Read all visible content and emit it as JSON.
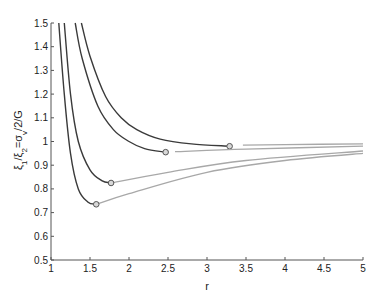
{
  "chart_data": {
    "type": "line",
    "title": "",
    "xlabel": "r",
    "ylabel": "ξ1/ξ2=σv/2/G",
    "xlim": [
      1,
      5
    ],
    "ylim": [
      0.5,
      1.5
    ],
    "xticks": [
      "1",
      "1.5",
      "2",
      "2.5",
      "3",
      "3.5",
      "4",
      "4.5",
      "5"
    ],
    "yticks": [
      "0.5",
      "0.6",
      "0.7",
      "0.8",
      "0.9",
      "1",
      "1.1",
      "1.2",
      "1.3",
      "1.4",
      "1.5"
    ],
    "grid": false,
    "legend": null,
    "series": [
      {
        "name": "curve-1",
        "dark_segment": [
          [
            1.39,
            1.5
          ],
          [
            1.5,
            1.36
          ],
          [
            1.7,
            1.19
          ],
          [
            1.9,
            1.1
          ],
          [
            2.1,
            1.05
          ],
          [
            2.4,
            1.01
          ],
          [
            2.8,
            0.99
          ],
          [
            3.29,
            0.98
          ]
        ],
        "marker": [
          3.29,
          0.98
        ],
        "light_segment": [
          [
            3.46,
            0.985
          ],
          [
            4.0,
            0.987
          ],
          [
            5.0,
            0.99
          ]
        ]
      },
      {
        "name": "curve-2",
        "dark_segment": [
          [
            1.31,
            1.5
          ],
          [
            1.4,
            1.35
          ],
          [
            1.6,
            1.15
          ],
          [
            1.8,
            1.05
          ],
          [
            2.0,
            1.0
          ],
          [
            2.2,
            0.97
          ],
          [
            2.47,
            0.955
          ]
        ],
        "marker": [
          2.47,
          0.955
        ],
        "light_segment": [
          [
            2.59,
            0.957
          ],
          [
            3.5,
            0.968
          ],
          [
            5.0,
            0.98
          ]
        ]
      },
      {
        "name": "curve-3",
        "dark_segment": [
          [
            1.17,
            1.5
          ],
          [
            1.25,
            1.2
          ],
          [
            1.35,
            1.0
          ],
          [
            1.5,
            0.88
          ],
          [
            1.65,
            0.835
          ],
          [
            1.77,
            0.825
          ]
        ],
        "marker": [
          1.77,
          0.825
        ],
        "light_segment": [
          [
            1.77,
            0.825
          ],
          [
            2.5,
            0.87
          ],
          [
            3.5,
            0.92
          ],
          [
            5.0,
            0.96
          ]
        ]
      },
      {
        "name": "curve-4",
        "dark_segment": [
          [
            1.1,
            1.5
          ],
          [
            1.17,
            1.2
          ],
          [
            1.25,
            0.95
          ],
          [
            1.35,
            0.8
          ],
          [
            1.47,
            0.745
          ],
          [
            1.58,
            0.735
          ]
        ],
        "marker": [
          1.58,
          0.735
        ],
        "light_segment": [
          [
            1.58,
            0.735
          ],
          [
            2.0,
            0.78
          ],
          [
            3.0,
            0.87
          ],
          [
            4.0,
            0.92
          ],
          [
            5.0,
            0.95
          ]
        ]
      }
    ],
    "colors": {
      "dark_line": "#3a3a3a",
      "light_line": "#a8a8a8",
      "axis": "#555555"
    }
  }
}
